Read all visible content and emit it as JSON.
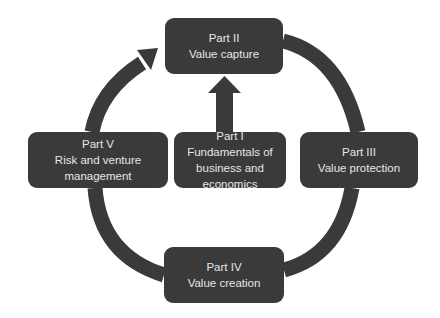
{
  "diagram": {
    "type": "cycle",
    "colors": {
      "box_fill": "#3a3a3a",
      "box_text": "#e6e6e6",
      "connector": "#3a3a3a",
      "background": "#ffffff"
    },
    "nodes": {
      "top": {
        "part": "Part II",
        "title": "Value capture"
      },
      "right": {
        "part": "Part III",
        "title": "Value protection"
      },
      "bottom": {
        "part": "Part IV",
        "title": "Value creation"
      },
      "left": {
        "part": "Part V",
        "title": "Risk and venture management"
      },
      "center": {
        "part": "Part I",
        "title": "Fundamentals of business and economics"
      }
    },
    "edges": [
      {
        "from": "top",
        "to": "right",
        "style": "arc"
      },
      {
        "from": "right",
        "to": "bottom",
        "style": "arc"
      },
      {
        "from": "bottom",
        "to": "left",
        "style": "arc"
      },
      {
        "from": "left",
        "to": "top",
        "style": "arc-arrow"
      },
      {
        "from": "center",
        "to": "top",
        "style": "block-arrow"
      }
    ]
  }
}
